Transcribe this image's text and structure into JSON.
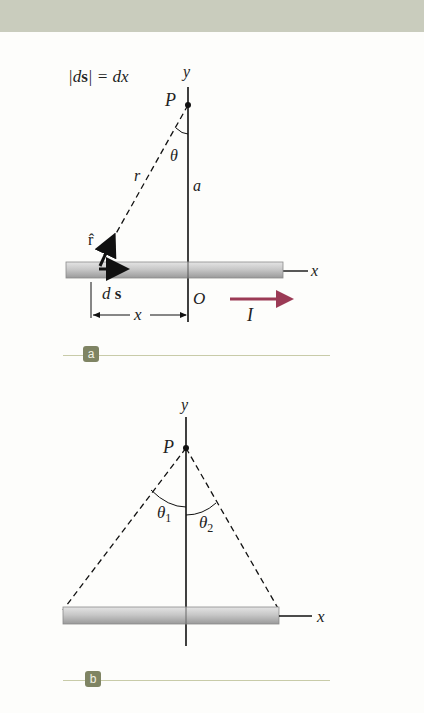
{
  "header_band": {
    "color": "#c9ccbd"
  },
  "figure_a": {
    "badge": "a",
    "equation": {
      "lhs": "|d",
      "vec": "s",
      "rhs": "| = dx"
    },
    "labels": {
      "y_axis": "y",
      "x_axis": "x",
      "point": "P",
      "angle": "θ",
      "distance_r": "r",
      "distance_a": "a",
      "unit_vector": "r̂",
      "ds_d": "d",
      "ds_s": "s",
      "origin": "O",
      "offset_x": "x",
      "current": "I"
    },
    "colors": {
      "current_arrow": "#9b3a55",
      "wire": "#c4c4c4"
    }
  },
  "figure_b": {
    "badge": "b",
    "labels": {
      "y_axis": "y",
      "x_axis": "x",
      "point": "P",
      "theta1": "θ",
      "theta1_sub": "1",
      "theta2": "θ",
      "theta2_sub": "2"
    }
  },
  "badge_color": "#7f8463"
}
